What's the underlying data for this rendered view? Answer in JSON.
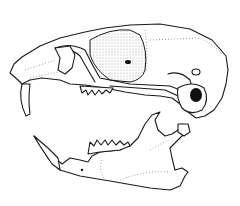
{
  "figure": {
    "parts": [
      "cranium",
      "mandible"
    ],
    "style": "black line drawing on white background",
    "colors": {
      "background": "#ffffff",
      "ink": "#1a1a1a"
    }
  }
}
